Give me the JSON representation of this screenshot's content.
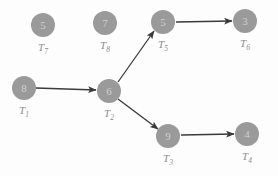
{
  "diagram": {
    "background_color": "#fdfdfd",
    "node_fill_color": "#9a9a9a",
    "node_text_color": "#cfcfcf",
    "label_text_color": "#8d8d8d",
    "edge_color": "#3a3a3a",
    "nodes": [
      {
        "id": "T7",
        "value": "5",
        "label_base": "T",
        "label_sub": "7",
        "cx": 43,
        "cy": 25,
        "r": 12
      },
      {
        "id": "T8",
        "value": "7",
        "label_base": "T",
        "label_sub": "8",
        "cx": 105,
        "cy": 23,
        "r": 12
      },
      {
        "id": "T5",
        "value": "5",
        "label_base": "T",
        "label_sub": "5",
        "cx": 163,
        "cy": 22,
        "r": 12
      },
      {
        "id": "T6",
        "value": "3",
        "label_base": "T",
        "label_sub": "6",
        "cx": 245,
        "cy": 21,
        "r": 12
      },
      {
        "id": "T1",
        "value": "8",
        "label_base": "T",
        "label_sub": "1",
        "cx": 24,
        "cy": 88,
        "r": 12
      },
      {
        "id": "T2",
        "value": "6",
        "label_base": "T",
        "label_sub": "2",
        "cx": 109,
        "cy": 91,
        "r": 12
      },
      {
        "id": "T3",
        "value": "9",
        "label_base": "T",
        "label_sub": "3",
        "cx": 168,
        "cy": 136,
        "r": 12
      },
      {
        "id": "T4",
        "value": "4",
        "label_base": "T",
        "label_sub": "4",
        "cx": 247,
        "cy": 134,
        "r": 12
      }
    ],
    "edges": [
      {
        "from": "T1",
        "to": "T2",
        "x1": 36,
        "y1": 88,
        "x2": 96,
        "y2": 90
      },
      {
        "from": "T2",
        "to": "T5",
        "x1": 118,
        "y1": 82,
        "x2": 154,
        "y2": 31
      },
      {
        "from": "T2",
        "to": "T3",
        "x1": 118,
        "y1": 99,
        "x2": 158,
        "y2": 129
      },
      {
        "from": "T5",
        "to": "T6",
        "x1": 176,
        "y1": 22,
        "x2": 232,
        "y2": 21
      },
      {
        "from": "T3",
        "to": "T4",
        "x1": 181,
        "y1": 135,
        "x2": 234,
        "y2": 134
      }
    ]
  }
}
